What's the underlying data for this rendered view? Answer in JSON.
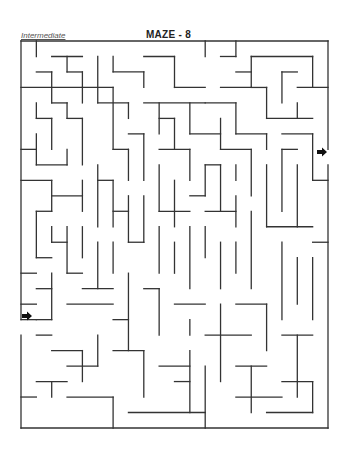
{
  "header": {
    "level": "Intermediate",
    "title": "MAZE - 8"
  },
  "maze": {
    "origin": [
      21,
      41
    ],
    "cell_w": 15.35,
    "cell_h": 15.48,
    "cols": 20,
    "rows": 25,
    "wall_color": "#333333",
    "stroke_width": 1.3,
    "border": [
      [
        0,
        0,
        20,
        0
      ],
      [
        20,
        0,
        20,
        7
      ],
      [
        20,
        8,
        20,
        25
      ],
      [
        0,
        25,
        20,
        25
      ],
      [
        0,
        0,
        0,
        18
      ],
      [
        0,
        19,
        0,
        25
      ]
    ],
    "walls": [
      [
        1,
        0,
        1,
        1
      ],
      [
        2,
        1,
        4,
        1
      ],
      [
        3,
        1,
        3,
        2
      ],
      [
        3,
        2,
        4,
        2
      ],
      [
        4,
        2,
        4,
        3
      ],
      [
        1,
        2,
        2,
        2
      ],
      [
        2,
        2,
        2,
        4
      ],
      [
        0,
        3,
        6,
        3
      ],
      [
        6,
        1,
        6,
        2
      ],
      [
        6,
        2,
        8,
        2
      ],
      [
        8,
        2,
        8,
        3
      ],
      [
        8,
        1,
        10,
        1
      ],
      [
        10,
        1,
        10,
        3
      ],
      [
        10,
        3,
        12,
        3
      ],
      [
        12,
        0,
        12,
        1
      ],
      [
        5,
        1,
        5,
        4
      ],
      [
        5,
        4,
        7,
        4
      ],
      [
        7,
        4,
        7,
        5
      ],
      [
        6,
        3,
        6,
        7
      ],
      [
        4,
        3,
        4,
        4
      ],
      [
        2,
        4,
        3,
        4
      ],
      [
        3,
        4,
        3,
        5
      ],
      [
        3,
        5,
        4,
        5
      ],
      [
        4,
        5,
        4,
        8
      ],
      [
        1,
        4,
        1,
        5
      ],
      [
        1,
        5,
        2,
        5
      ],
      [
        2,
        5,
        2,
        7
      ],
      [
        1,
        6,
        1,
        8
      ],
      [
        0,
        7,
        1,
        7
      ],
      [
        8,
        4,
        12,
        4
      ],
      [
        9,
        4,
        9,
        6
      ],
      [
        9,
        5,
        10,
        5
      ],
      [
        10,
        5,
        10,
        7
      ],
      [
        11,
        4,
        11,
        6
      ],
      [
        11,
        6,
        13,
        6
      ],
      [
        13,
        5,
        13,
        7
      ],
      [
        7,
        6,
        8,
        6
      ],
      [
        8,
        6,
        8,
        9
      ],
      [
        6,
        7,
        7,
        7
      ],
      [
        7,
        7,
        7,
        9
      ],
      [
        9,
        7,
        11,
        7
      ],
      [
        11,
        7,
        11,
        9
      ],
      [
        13,
        1,
        14,
        1
      ],
      [
        14,
        0,
        14,
        1
      ],
      [
        14,
        2,
        15,
        2
      ],
      [
        15,
        1,
        15,
        3
      ],
      [
        15,
        1,
        19,
        1
      ],
      [
        19,
        1,
        19,
        3
      ],
      [
        13,
        3,
        15,
        3
      ],
      [
        15,
        3,
        16,
        3
      ],
      [
        16,
        3,
        16,
        5
      ],
      [
        17,
        2,
        17,
        4
      ],
      [
        17,
        2,
        18,
        2
      ],
      [
        18,
        3,
        20,
        3
      ],
      [
        18,
        4,
        18,
        5
      ],
      [
        16,
        5,
        19,
        5
      ],
      [
        12,
        4,
        14,
        4
      ],
      [
        14,
        4,
        14,
        6
      ],
      [
        14,
        6,
        16,
        6
      ],
      [
        16,
        6,
        16,
        7
      ],
      [
        17,
        6,
        19,
        6
      ],
      [
        19,
        6,
        19,
        9
      ],
      [
        13,
        7,
        15,
        7
      ],
      [
        15,
        7,
        15,
        10
      ],
      [
        14,
        8,
        14,
        9
      ],
      [
        17,
        7,
        18,
        7
      ],
      [
        17,
        7,
        17,
        11
      ],
      [
        18,
        8,
        18,
        12
      ],
      [
        19,
        9,
        20,
        9
      ],
      [
        0,
        9,
        2,
        9
      ],
      [
        3,
        7,
        3,
        8
      ],
      [
        1,
        8,
        3,
        8
      ],
      [
        2,
        9,
        2,
        11
      ],
      [
        2,
        10,
        4,
        10
      ],
      [
        4,
        9,
        4,
        11
      ],
      [
        5,
        8,
        5,
        12
      ],
      [
        5,
        9,
        6,
        9
      ],
      [
        6,
        9,
        6,
        12
      ],
      [
        6,
        11,
        7,
        11
      ],
      [
        7,
        10,
        7,
        13
      ],
      [
        8,
        10,
        8,
        13
      ],
      [
        9,
        8,
        9,
        11
      ],
      [
        9,
        11,
        11,
        11
      ],
      [
        10,
        9,
        10,
        12
      ],
      [
        12,
        8,
        12,
        10
      ],
      [
        12,
        8,
        13,
        8
      ],
      [
        13,
        8,
        13,
        11
      ],
      [
        11,
        10,
        12,
        10
      ],
      [
        12,
        11,
        14,
        11
      ],
      [
        14,
        10,
        14,
        12
      ],
      [
        16,
        8,
        16,
        12
      ],
      [
        16,
        12,
        19,
        12
      ],
      [
        19,
        13,
        20,
        13
      ],
      [
        1,
        11,
        2,
        11
      ],
      [
        1,
        11,
        1,
        14
      ],
      [
        1,
        14,
        2,
        14
      ],
      [
        2,
        12,
        2,
        13
      ],
      [
        2,
        13,
        3,
        13
      ],
      [
        3,
        12,
        3,
        15
      ],
      [
        3,
        15,
        4,
        15
      ],
      [
        4,
        12,
        4,
        14
      ],
      [
        5,
        13,
        5,
        16
      ],
      [
        4,
        16,
        6,
        16
      ],
      [
        6,
        13,
        6,
        15
      ],
      [
        7,
        13,
        8,
        13
      ],
      [
        9,
        12,
        9,
        15
      ],
      [
        10,
        13,
        10,
        15
      ],
      [
        11,
        12,
        11,
        16
      ],
      [
        12,
        12,
        12,
        14
      ],
      [
        13,
        13,
        13,
        16
      ],
      [
        14,
        13,
        14,
        15
      ],
      [
        15,
        11,
        15,
        16
      ],
      [
        17,
        13,
        17,
        18
      ],
      [
        18,
        14,
        18,
        17
      ],
      [
        19,
        14,
        19,
        18
      ],
      [
        0,
        15,
        1,
        15
      ],
      [
        1,
        16,
        2,
        16
      ],
      [
        2,
        15,
        2,
        18
      ],
      [
        1,
        18,
        2,
        18
      ],
      [
        0,
        18,
        1,
        18
      ],
      [
        0,
        17,
        1,
        17
      ],
      [
        3,
        17,
        6,
        17
      ],
      [
        6,
        18,
        7,
        18
      ],
      [
        7,
        15,
        7,
        20
      ],
      [
        8,
        16,
        9,
        16
      ],
      [
        9,
        16,
        9,
        19
      ],
      [
        10,
        17,
        12,
        17
      ],
      [
        11,
        18,
        11,
        19
      ],
      [
        12,
        19,
        15,
        19
      ],
      [
        13,
        17,
        13,
        22
      ],
      [
        14,
        17,
        16,
        17
      ],
      [
        16,
        17,
        16,
        20
      ],
      [
        1,
        19,
        2,
        19
      ],
      [
        2,
        20,
        4,
        20
      ],
      [
        4,
        20,
        4,
        22
      ],
      [
        3,
        21,
        5,
        21
      ],
      [
        1,
        22,
        3,
        22
      ],
      [
        2,
        22,
        2,
        23
      ],
      [
        0,
        23,
        1,
        23
      ],
      [
        5,
        19,
        5,
        21
      ],
      [
        6,
        20,
        8,
        20
      ],
      [
        8,
        20,
        8,
        23
      ],
      [
        9,
        21,
        11,
        21
      ],
      [
        11,
        20,
        11,
        24
      ],
      [
        10,
        22,
        11,
        22
      ],
      [
        3,
        23,
        6,
        23
      ],
      [
        6,
        23,
        6,
        25
      ],
      [
        7,
        24,
        12,
        24
      ],
      [
        12,
        21,
        12,
        25
      ],
      [
        14,
        21,
        16,
        21
      ],
      [
        15,
        21,
        15,
        24
      ],
      [
        17,
        19,
        19,
        19
      ],
      [
        18,
        19,
        18,
        23
      ],
      [
        17,
        22,
        19,
        22
      ],
      [
        19,
        22,
        19,
        24
      ],
      [
        14,
        23,
        17,
        23
      ],
      [
        16,
        24,
        19,
        24
      ]
    ],
    "entry_arrow": {
      "x": 22,
      "y": 316,
      "direction": "right"
    },
    "exit_arrow": {
      "x": 317,
      "y": 152,
      "direction": "right"
    }
  }
}
